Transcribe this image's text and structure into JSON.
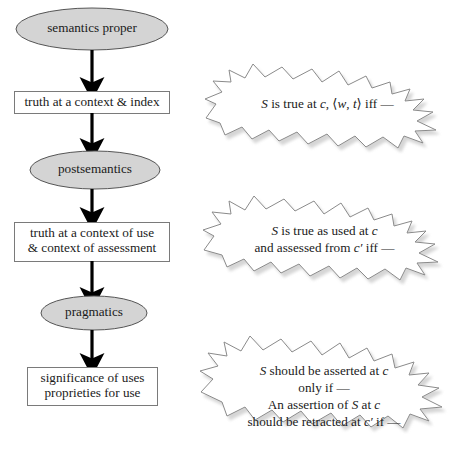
{
  "figure": {
    "background_color": "#ffffff",
    "line_color": "#000000",
    "ellipse_fill": "#d4d4d4",
    "ellipse_stroke": "#555555",
    "box_fill": "#ffffff",
    "box_stroke": "#7a7a7a",
    "burst_fill": "#ffffff",
    "burst_stroke": "#8a8a8a",
    "shadow_color": "#b8b8b8"
  },
  "flow": {
    "nodes": [
      {
        "id": "semantics-proper",
        "shape": "ellipse",
        "label": "semantics proper"
      },
      {
        "id": "truth-context-index",
        "shape": "box",
        "label": "truth at a context & index"
      },
      {
        "id": "postsemantics",
        "shape": "ellipse",
        "label": "postsemantics"
      },
      {
        "id": "truth-use-assessment",
        "shape": "box",
        "label": "truth at a context of use\n& context of assessment"
      },
      {
        "id": "pragmatics",
        "shape": "ellipse",
        "label": "pragmatics"
      },
      {
        "id": "significance-proprieties",
        "shape": "box",
        "label": "significance of uses\nproprieties for use"
      }
    ],
    "arrows": [
      {
        "id": "arrow-1",
        "from": "semantics-proper",
        "to": "truth-context-index"
      },
      {
        "id": "arrow-2",
        "from": "truth-context-index",
        "to": "postsemantics"
      },
      {
        "id": "arrow-3",
        "from": "postsemantics",
        "to": "truth-use-assessment"
      },
      {
        "id": "arrow-4",
        "from": "truth-use-assessment",
        "to": "pragmatics"
      },
      {
        "id": "arrow-5",
        "from": "pragmatics",
        "to": "significance-proprieties"
      }
    ]
  },
  "callouts": [
    {
      "id": "callout-truth-context-index",
      "lines": [
        [
          {
            "t": "S",
            "style": "italic"
          },
          {
            "t": " is true at ",
            "style": "normal"
          },
          {
            "t": "c",
            "style": "italic"
          },
          {
            "t": ", ⟨",
            "style": "normal"
          },
          {
            "t": "w",
            "style": "italic"
          },
          {
            "t": ", ",
            "style": "normal"
          },
          {
            "t": "t",
            "style": "italic"
          },
          {
            "t": "⟩ iff —",
            "style": "normal"
          }
        ]
      ],
      "plain": "S is true at c, ⟨w, t⟩ iff —"
    },
    {
      "id": "callout-truth-use-assessment",
      "lines": [
        [
          {
            "t": "S",
            "style": "italic"
          },
          {
            "t": " is true as used at ",
            "style": "normal"
          },
          {
            "t": "c",
            "style": "italic"
          }
        ],
        [
          {
            "t": "and assessed from ",
            "style": "normal"
          },
          {
            "t": "c′",
            "style": "italic"
          },
          {
            "t": " iff —",
            "style": "normal"
          }
        ]
      ],
      "plain": "S is true as used at c\nand assessed from c′ iff —"
    },
    {
      "id": "callout-pragmatics",
      "lines": [
        [
          {
            "t": "S",
            "style": "italic"
          },
          {
            "t": " should be asserted at ",
            "style": "normal"
          },
          {
            "t": "c",
            "style": "italic"
          }
        ],
        [
          {
            "t": "only if —",
            "style": "normal"
          }
        ],
        [
          {
            "t": "An assertion of ",
            "style": "normal"
          },
          {
            "t": "S",
            "style": "italic"
          },
          {
            "t": " at ",
            "style": "normal"
          },
          {
            "t": "c",
            "style": "italic"
          }
        ],
        [
          {
            "t": "should be retracted at ",
            "style": "normal"
          },
          {
            "t": "c′",
            "style": "italic"
          },
          {
            "t": " if —",
            "style": "normal"
          }
        ]
      ],
      "plain": "S should be asserted at c\nonly if —\nAn assertion of S at c\nshould be retracted at c′ if —"
    }
  ]
}
